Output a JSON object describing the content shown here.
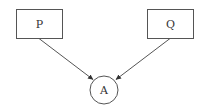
{
  "diagram": {
    "nodes": [
      {
        "id": "P",
        "label": "P",
        "shape": "rect"
      },
      {
        "id": "Q",
        "label": "Q",
        "shape": "rect"
      },
      {
        "id": "A",
        "label": "A",
        "shape": "circle"
      }
    ],
    "edges": [
      {
        "from": "P",
        "to": "A"
      },
      {
        "from": "Q",
        "to": "A"
      }
    ],
    "colors": {
      "stroke": "#555555",
      "text": "#333333",
      "background": "#ffffff"
    }
  }
}
